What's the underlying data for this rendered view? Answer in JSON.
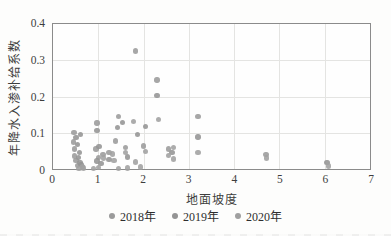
{
  "chart_data": {
    "type": "scatter",
    "title": "",
    "xlabel": "地面坡度",
    "ylabel": "年降水入渗补给系数",
    "xlim": [
      0,
      7
    ],
    "ylim": [
      0,
      0.4
    ],
    "xticks": [
      0,
      1,
      2,
      3,
      4,
      5,
      6,
      7
    ],
    "yticks": [
      0,
      0.1,
      0.2,
      0.3,
      0.4
    ],
    "grid": true,
    "legend_position": "bottom",
    "axis_color": "#8b8b8b",
    "grid_color": "#e4e4e2",
    "text_color": "#3d3d3d",
    "series": [
      {
        "name": "2018年",
        "color": "#9b9b9b",
        "points": [
          [
            0.46,
            0.101
          ],
          [
            0.45,
            0.074
          ],
          [
            0.48,
            0.055
          ],
          [
            0.47,
            0.036
          ],
          [
            0.51,
            0.023
          ],
          [
            0.54,
            0.009
          ],
          [
            0.97,
            0.127
          ],
          [
            0.95,
            0.055
          ],
          [
            1.0,
            0.032
          ],
          [
            1.1,
            0.04
          ],
          [
            1.24,
            0.046
          ],
          [
            1.38,
            0.077
          ],
          [
            1.45,
            0.145
          ],
          [
            1.6,
            0.06
          ],
          [
            1.82,
            0.326
          ],
          [
            2.0,
            0.063
          ],
          [
            2.3,
            0.246
          ],
          [
            2.55,
            0.055
          ],
          [
            3.2,
            0.145
          ],
          [
            4.7,
            0.04
          ]
        ]
      },
      {
        "name": "2019年",
        "color": "#949494",
        "points": [
          [
            0.51,
            0.087
          ],
          [
            0.54,
            0.068
          ],
          [
            0.58,
            0.046
          ],
          [
            0.56,
            0.032
          ],
          [
            0.6,
            0.018
          ],
          [
            0.62,
            0.012
          ],
          [
            0.61,
            0.095
          ],
          [
            0.97,
            0.106
          ],
          [
            1.02,
            0.062
          ],
          [
            0.97,
            0.022
          ],
          [
            1.06,
            0.015
          ],
          [
            1.24,
            0.026
          ],
          [
            1.43,
            0.114
          ],
          [
            1.54,
            0.128
          ],
          [
            1.64,
            0.033
          ],
          [
            1.87,
            0.096
          ],
          [
            2.04,
            0.118
          ],
          [
            2.3,
            0.202
          ],
          [
            2.63,
            0.045
          ],
          [
            3.2,
            0.088
          ],
          [
            6.05,
            0.018
          ]
        ]
      },
      {
        "name": "2020年",
        "color": "#a0a0a0",
        "points": [
          [
            0.65,
            0.005
          ],
          [
            0.57,
            0.002
          ],
          [
            0.68,
            0.003
          ],
          [
            0.9,
            0.002
          ],
          [
            1.0,
            0.004
          ],
          [
            1.12,
            0.03
          ],
          [
            1.31,
            0.041
          ],
          [
            1.35,
            0.023
          ],
          [
            1.45,
            0.002
          ],
          [
            1.6,
            0.046
          ],
          [
            1.65,
            0.003
          ],
          [
            1.78,
            0.131
          ],
          [
            1.82,
            0.019
          ],
          [
            1.93,
            0.005
          ],
          [
            2.04,
            0.049
          ],
          [
            2.33,
            0.137
          ],
          [
            2.55,
            0.037
          ],
          [
            2.66,
            0.06
          ],
          [
            2.66,
            0.028
          ],
          [
            3.2,
            0.045
          ],
          [
            4.72,
            0.03
          ],
          [
            6.08,
            0.008
          ]
        ]
      }
    ]
  }
}
